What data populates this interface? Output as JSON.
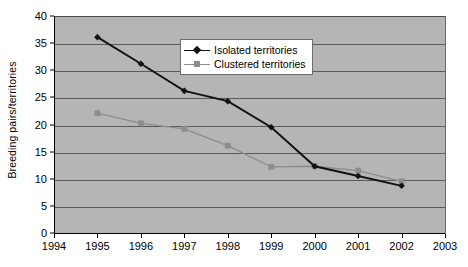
{
  "chart_data": {
    "type": "line",
    "title": "",
    "xlabel": "",
    "ylabel": "Breeding pairs/territories",
    "x": [
      1995,
      1996,
      1997,
      1998,
      1999,
      2000,
      2001,
      2002
    ],
    "xlim": [
      1994,
      2003
    ],
    "ylim": [
      0,
      40
    ],
    "xticks": [
      "1994",
      "1995",
      "1996",
      "1997",
      "1998",
      "1999",
      "2000",
      "2001",
      "2002",
      "2003"
    ],
    "yticks": [
      "0",
      "5",
      "10",
      "15",
      "20",
      "25",
      "30",
      "35",
      "40"
    ],
    "grid": true,
    "legend_position": "upper-center",
    "series": [
      {
        "name": "Isolated territories",
        "marker": "diamond",
        "color": "#111111",
        "values": [
          36.1,
          31.2,
          26.2,
          24.3,
          19.5,
          12.3,
          10.5,
          8.7
        ]
      },
      {
        "name": "Clustered territories",
        "marker": "square",
        "color": "#8d8d8d",
        "values": [
          22.1,
          20.2,
          19.2,
          16.1,
          12.2,
          12.3,
          11.5,
          9.5
        ]
      }
    ]
  },
  "legend": {
    "items": [
      {
        "label": "Isolated territories"
      },
      {
        "label": "Clustered territories"
      }
    ]
  },
  "style": {
    "plot_background": "#b5b5b5",
    "gridline_color": "#5a5a5a",
    "page_background": "#ffffff",
    "isolated_color": "#111111",
    "clustered_color": "#8d8d8d"
  }
}
